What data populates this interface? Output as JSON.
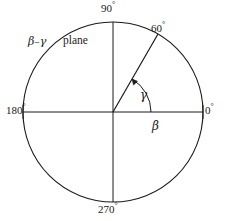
{
  "figure": {
    "name": "beta-gamma-plane-polar-diagram",
    "type": "polar-angle-diagram",
    "background_color": "#ffffff",
    "stroke_color": "#1a1a1a",
    "annotation": {
      "plane_symbols": "β–γ",
      "plane_word": "plane"
    },
    "angle_labels": {
      "right": "0°",
      "upper_right": "60°",
      "top": "90°",
      "left": "180°",
      "bottom": "270°"
    },
    "degree_values": {
      "right": "0",
      "upper_right": "60",
      "top": "90",
      "left": "180",
      "bottom": "270",
      "degree_sign": "°"
    },
    "axis_symbols": {
      "horizontal": "β",
      "angle": "γ"
    },
    "geometry": {
      "center_x": 113,
      "center_y": 112,
      "radius": 90,
      "ray_angle_deg": 60,
      "arc_radius": 38,
      "tick_length": 7
    }
  }
}
